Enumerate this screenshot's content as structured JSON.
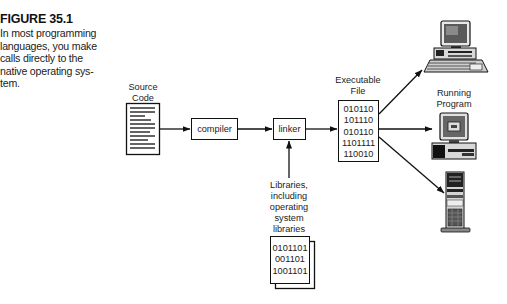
{
  "caption": {
    "title": "FIGURE 35.1",
    "body_lines": [
      "In most programming",
      "languages, you make",
      "calls directly to the",
      "native operating sys-",
      "tem."
    ]
  },
  "diagram": {
    "source_code": {
      "label_lines": [
        "Source",
        "Code"
      ]
    },
    "compiler": {
      "label": "compiler"
    },
    "linker": {
      "label": "linker"
    },
    "executable": {
      "label_lines": [
        "Executable",
        "File"
      ],
      "binary_lines": [
        "010110",
        "101110",
        "010110",
        "1101111",
        "110010"
      ]
    },
    "libraries": {
      "label_lines": [
        "Libraries,",
        "including",
        "operating",
        "system",
        "libraries"
      ],
      "binary_lines": [
        "0101101",
        "001101",
        "1001101"
      ]
    },
    "running_program": {
      "label_lines": [
        "Running",
        "Program"
      ]
    },
    "targets": [
      "desktop-computer",
      "desktop-computer-running",
      "tower-server"
    ]
  },
  "colors": {
    "ink": "#111111",
    "background": "#ffffff",
    "screen_gray": "#6a6a6a"
  }
}
